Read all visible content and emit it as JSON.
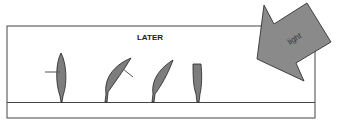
{
  "title": "LATER",
  "arrow": {
    "label": "light",
    "fill": "#8a8a8a"
  },
  "seedlings": [
    {
      "id": 1,
      "pose": "upright",
      "marker": "horizontal-left"
    },
    {
      "id": 2,
      "pose": "bent-toward-light",
      "marker": "diagonal"
    },
    {
      "id": 3,
      "pose": "bent-toward-light",
      "marker": "none"
    },
    {
      "id": 4,
      "pose": "upright-tip-removed",
      "marker": "none"
    }
  ],
  "colors": {
    "plant": "#7d7d7d",
    "outline": "#222222",
    "box": "#444444"
  }
}
